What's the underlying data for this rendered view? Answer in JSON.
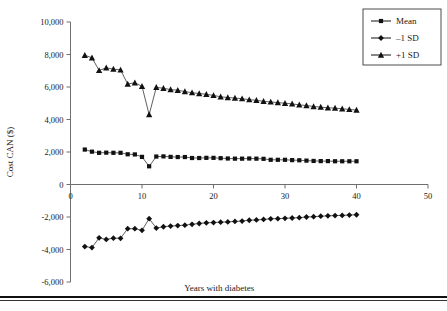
{
  "chart_data": {
    "type": "scatter",
    "title": "",
    "xlabel": "Years with diabetes",
    "ylabel": "Cost CAN ($)",
    "xlim": [
      0,
      50
    ],
    "ylim": [
      -6000,
      10000
    ],
    "xticks": [
      0,
      10,
      20,
      30,
      40,
      50
    ],
    "xtick_labels": [
      "0",
      "10",
      "20",
      "30",
      "40",
      "50"
    ],
    "yticks": [
      -6000,
      -4000,
      -2000,
      0,
      2000,
      4000,
      6000,
      8000,
      10000
    ],
    "ytick_labels": [
      "-6,000",
      "-4,000",
      "-2,000",
      "0",
      "2,000",
      "4,000",
      "6,000",
      "8,000",
      "10,000"
    ],
    "grid": false,
    "legend_position": "top-right",
    "x": [
      2,
      3,
      4,
      5,
      6,
      7,
      8,
      9,
      10,
      11,
      12,
      13,
      14,
      15,
      16,
      17,
      18,
      19,
      20,
      21,
      22,
      23,
      24,
      25,
      26,
      27,
      28,
      29,
      30,
      31,
      32,
      33,
      34,
      35,
      36,
      37,
      38,
      39,
      40
    ],
    "series": [
      {
        "name": "Mean",
        "marker": "square",
        "values": [
          2150,
          2020,
          1950,
          1960,
          1950,
          1950,
          1860,
          1850,
          1700,
          1120,
          1720,
          1730,
          1700,
          1690,
          1690,
          1630,
          1630,
          1640,
          1640,
          1620,
          1600,
          1590,
          1590,
          1600,
          1590,
          1580,
          1520,
          1520,
          1520,
          1500,
          1490,
          1470,
          1450,
          1440,
          1440,
          1430,
          1430,
          1430,
          1430
        ]
      },
      {
        "name": "-1 SD",
        "marker": "diamond",
        "values": [
          -3820,
          -3880,
          -3280,
          -3380,
          -3300,
          -3310,
          -2720,
          -2720,
          -2820,
          -2100,
          -2680,
          -2600,
          -2560,
          -2530,
          -2500,
          -2450,
          -2400,
          -2360,
          -2340,
          -2320,
          -2300,
          -2270,
          -2250,
          -2200,
          -2180,
          -2150,
          -2110,
          -2100,
          -2080,
          -2060,
          -2040,
          -2000,
          -1980,
          -1950,
          -1930,
          -1910,
          -1900,
          -1880,
          -1860
        ]
      },
      {
        "name": "+1 SD",
        "marker": "triangle",
        "values": [
          7950,
          7800,
          7020,
          7180,
          7100,
          7050,
          6180,
          6260,
          6040,
          4300,
          5980,
          5920,
          5840,
          5800,
          5720,
          5650,
          5600,
          5550,
          5480,
          5400,
          5350,
          5320,
          5280,
          5220,
          5180,
          5120,
          5080,
          5040,
          5000,
          4960,
          4900,
          4860,
          4800,
          4760,
          4720,
          4700,
          4660,
          4620,
          4580
        ]
      }
    ]
  },
  "legend": {
    "items": [
      {
        "label": "Mean",
        "marker": "square"
      },
      {
        "label": "–1 SD",
        "marker": "diamond"
      },
      {
        "label": "+1 SD",
        "marker": "triangle"
      }
    ]
  }
}
